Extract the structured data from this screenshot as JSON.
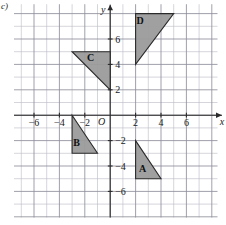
{
  "part_label": "c)",
  "axes": {
    "x_axis_name": "x",
    "y_axis_name": "y",
    "origin_label": "O",
    "x_ticks": [
      {
        "value": -6,
        "label": "−6"
      },
      {
        "value": -4,
        "label": "−4"
      },
      {
        "value": -2,
        "label": "−2"
      },
      {
        "value": 2,
        "label": "2"
      },
      {
        "value": 4,
        "label": "4"
      },
      {
        "value": 6,
        "label": "6"
      }
    ],
    "y_ticks": [
      {
        "value": 6,
        "label": "6"
      },
      {
        "value": 4,
        "label": "4"
      },
      {
        "value": 2,
        "label": "2"
      },
      {
        "value": -2,
        "label": "−2"
      },
      {
        "value": -4,
        "label": "−4"
      },
      {
        "value": -6,
        "label": "−6"
      }
    ],
    "x_range": [
      -7.5,
      8.5
    ],
    "y_range": [
      -8.5,
      8.5
    ],
    "grid": true,
    "grid_step": 1,
    "grid_major_step": 2
  },
  "style": {
    "shape_fill": "#9b9b9b",
    "shape_stroke": "#2a2a2a",
    "grid_minor_color": "#b9b9c4",
    "grid_major_color": "#8f8f9c",
    "axis_color": "#2b2b2b",
    "background": "#ffffff"
  },
  "chart_data": {
    "type": "scatter",
    "title": "",
    "xlabel": "x",
    "ylabel": "y",
    "shapes": [
      {
        "name": "A",
        "label": "A",
        "kind": "right-triangle",
        "vertices": [
          [
            2,
            -2
          ],
          [
            2,
            -5
          ],
          [
            4,
            -5
          ]
        ],
        "label_position": [
          2.55,
          -4.45
        ]
      },
      {
        "name": "B",
        "label": "B",
        "kind": "right-triangle",
        "vertices": [
          [
            -3,
            0
          ],
          [
            -3,
            -3
          ],
          [
            -1,
            -3
          ]
        ],
        "label_position": [
          -2.65,
          -2.45
        ]
      },
      {
        "name": "C",
        "label": "C",
        "kind": "right-triangle",
        "vertices": [
          [
            -3,
            5
          ],
          [
            0,
            5
          ],
          [
            0,
            2
          ]
        ],
        "label_position": [
          -1.55,
          4.3
        ]
      },
      {
        "name": "D",
        "label": "D",
        "kind": "right-triangle",
        "vertices": [
          [
            2,
            4
          ],
          [
            2,
            8
          ],
          [
            5,
            8
          ]
        ],
        "label_position": [
          2.35,
          7.2
        ]
      }
    ]
  }
}
